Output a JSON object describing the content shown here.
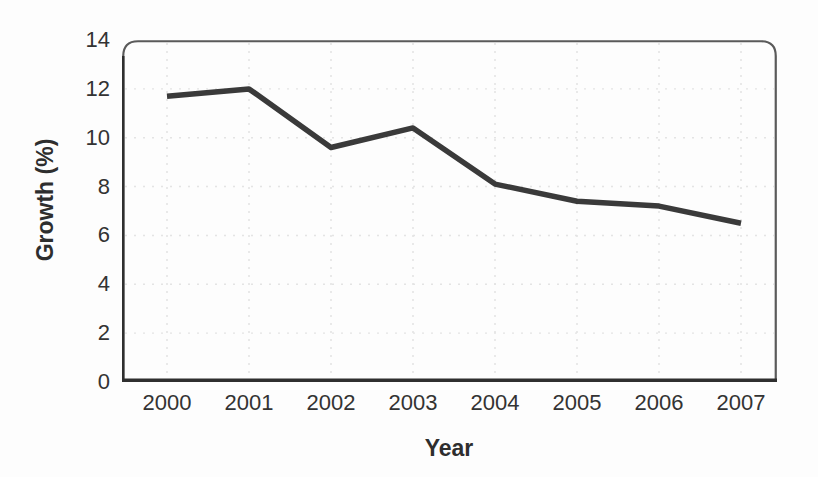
{
  "chart_data": {
    "type": "line",
    "title": "",
    "xlabel": "Year",
    "ylabel": "Growth (%)",
    "categories": [
      "2000",
      "2001",
      "2002",
      "2003",
      "2004",
      "2005",
      "2006",
      "2007"
    ],
    "series": [
      {
        "name": "Growth (%)",
        "values": [
          11.7,
          12,
          9.6,
          10.4,
          8.1,
          7.4,
          7.2,
          6.5
        ]
      }
    ],
    "ylim": [
      0,
      14
    ],
    "yticks": [
      0,
      2,
      4,
      6,
      8,
      10,
      12,
      14
    ],
    "grid": "light-dashed-both-axes",
    "legend_position": "none",
    "frame": "rounded-top-corners",
    "colors": {
      "line": "#3a3a3a",
      "axis": "#2f2f2f",
      "frame": "#5a5a5a",
      "grid": "#e4e4e4",
      "text": "#333333",
      "background": "#fdfdfd"
    }
  }
}
